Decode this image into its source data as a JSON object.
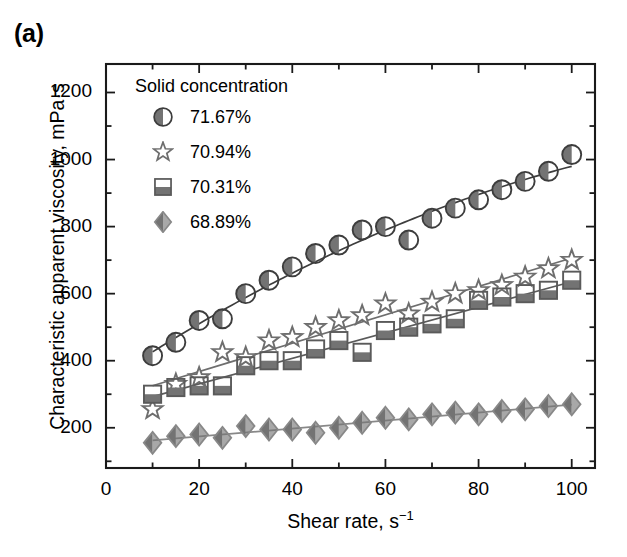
{
  "panel": {
    "label": "(a)"
  },
  "axes": {
    "xlabel_text": "Shear rate, s",
    "xlabel_sup": "−1",
    "ylabel": "Characteristic apparent viscosity, mPa·s",
    "xticks": [
      "0",
      "20",
      "40",
      "60",
      "80",
      "100"
    ],
    "yticks": [
      "200",
      "400",
      "600",
      "800",
      "1000",
      "1200"
    ]
  },
  "legend": {
    "title": "Solid concentration",
    "entries": [
      {
        "label": "71.67%",
        "marker": "half-filled-circle-icon"
      },
      {
        "label": "70.94%",
        "marker": "open-star-icon"
      },
      {
        "label": "70.31%",
        "marker": "bottom-filled-square-icon"
      },
      {
        "label": "68.89%",
        "marker": "left-filled-diamond-icon"
      }
    ]
  },
  "colors": {
    "axis": "#1a1a1a",
    "series1": "#3d3d3d",
    "series2": "#6e6e6e",
    "series3": "#5a5a5a",
    "series4": "#888888",
    "marker_fill_dark": "#737373",
    "marker_fill_light": "#ffffff"
  },
  "chart_data": {
    "type": "scatter",
    "title": "(a)",
    "xlabel": "Shear rate, s−1",
    "ylabel": "Characteristic apparent viscosity, mPa·s",
    "xlim": [
      0,
      105
    ],
    "ylim": [
      80,
      1285
    ],
    "grid": false,
    "legend_position": "upper-left-inside",
    "legend_title": "Solid concentration",
    "series": [
      {
        "name": "71.67%",
        "marker": "half-filled-circle",
        "x": [
          10,
          15,
          20,
          25,
          30,
          35,
          40,
          45,
          50,
          55,
          60,
          65,
          70,
          75,
          80,
          85,
          90,
          95,
          100
        ],
        "y": [
          415,
          455,
          520,
          525,
          600,
          640,
          680,
          720,
          745,
          790,
          800,
          760,
          825,
          855,
          880,
          910,
          935,
          965,
          1015
        ],
        "fit": {
          "type": "smooth",
          "x": [
            10,
            100
          ],
          "y": [
            405,
            1010
          ]
        }
      },
      {
        "name": "70.94%",
        "marker": "open-star",
        "x": [
          10,
          15,
          20,
          25,
          30,
          35,
          40,
          45,
          50,
          55,
          60,
          65,
          70,
          75,
          80,
          85,
          90,
          95,
          100
        ],
        "y": [
          255,
          330,
          350,
          425,
          410,
          460,
          470,
          500,
          520,
          535,
          570,
          540,
          575,
          600,
          610,
          625,
          650,
          675,
          700
        ],
        "fit": {
          "type": "linear",
          "x": [
            10,
            100
          ],
          "y": [
            310,
            690
          ]
        }
      },
      {
        "name": "70.31%",
        "marker": "bottom-filled-square",
        "x": [
          10,
          15,
          20,
          25,
          30,
          35,
          40,
          45,
          50,
          55,
          60,
          65,
          70,
          75,
          80,
          85,
          90,
          95,
          100
        ],
        "y": [
          300,
          320,
          325,
          325,
          385,
          400,
          400,
          435,
          460,
          425,
          490,
          500,
          510,
          525,
          580,
          590,
          600,
          610,
          640
        ],
        "fit": {
          "type": "linear",
          "x": [
            10,
            100
          ],
          "y": [
            290,
            640
          ]
        }
      },
      {
        "name": "68.89%",
        "marker": "left-filled-diamond",
        "x": [
          10,
          15,
          20,
          25,
          30,
          35,
          40,
          45,
          50,
          55,
          60,
          65,
          70,
          75,
          80,
          85,
          90,
          95,
          100
        ],
        "y": [
          155,
          175,
          180,
          170,
          205,
          195,
          195,
          185,
          200,
          215,
          230,
          225,
          240,
          245,
          240,
          250,
          255,
          265,
          270
        ],
        "fit": {
          "type": "linear",
          "x": [
            10,
            100
          ],
          "y": [
            160,
            272
          ]
        }
      }
    ]
  }
}
